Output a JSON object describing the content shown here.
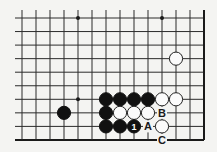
{
  "diagram": {
    "type": "go-board-fragment",
    "grid": {
      "columns": 14,
      "rows": 10,
      "x0": 22,
      "y0": 18,
      "dx": 14,
      "dy": 13.55,
      "open_left": true,
      "open_top": true,
      "edge_right": true,
      "edge_bottom": true
    },
    "star_points": [
      {
        "col": 4,
        "row": 0
      },
      {
        "col": 10,
        "row": 0
      },
      {
        "col": 4,
        "row": 6
      }
    ],
    "stones": [
      {
        "color": "black",
        "col": 3,
        "row": 7
      },
      {
        "color": "black",
        "col": 6,
        "row": 6
      },
      {
        "color": "black",
        "col": 7,
        "row": 6
      },
      {
        "color": "black",
        "col": 8,
        "row": 6
      },
      {
        "color": "black",
        "col": 9,
        "row": 6
      },
      {
        "color": "white",
        "col": 10,
        "row": 6
      },
      {
        "color": "white",
        "col": 11,
        "row": 6
      },
      {
        "color": "white",
        "col": 11,
        "row": 3
      },
      {
        "color": "black",
        "col": 6,
        "row": 7
      },
      {
        "color": "white",
        "col": 7,
        "row": 7
      },
      {
        "color": "white",
        "col": 8,
        "row": 7
      },
      {
        "color": "white",
        "col": 9,
        "row": 7
      },
      {
        "color": "black",
        "col": 6,
        "row": 8
      },
      {
        "color": "black",
        "col": 7,
        "row": 8
      },
      {
        "color": "black",
        "col": 8,
        "row": 8,
        "number": "1"
      },
      {
        "color": "white",
        "col": 10,
        "row": 8
      }
    ],
    "labels": [
      {
        "text": "A",
        "col": 9,
        "row": 8
      },
      {
        "text": "B",
        "col": 10,
        "row": 7
      },
      {
        "text": "C",
        "col": 10,
        "row": 9
      }
    ],
    "colors": {
      "background": "#f4f4f2",
      "line": "#2a2a2a",
      "black_stone": "#111111",
      "white_stone": "#fbfbfb"
    }
  }
}
